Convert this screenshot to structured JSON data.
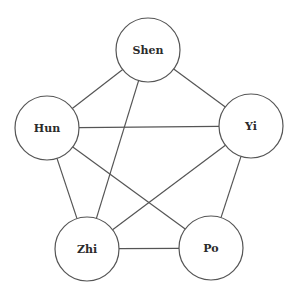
{
  "diagram": {
    "type": "complete-ish graph",
    "nodes": [
      {
        "id": "shen",
        "label": "Shen",
        "cx": 148,
        "cy": 50,
        "r": 32
      },
      {
        "id": "hun",
        "label": "Hun",
        "cx": 47,
        "cy": 128,
        "r": 32
      },
      {
        "id": "yi",
        "label": "Yi",
        "cx": 251,
        "cy": 126,
        "r": 32
      },
      {
        "id": "zhi",
        "label": "Zhi",
        "cx": 87,
        "cy": 249,
        "r": 32
      },
      {
        "id": "po",
        "label": "Po",
        "cx": 211,
        "cy": 248,
        "r": 32
      }
    ],
    "edges": [
      {
        "from": "shen",
        "to": "hun"
      },
      {
        "from": "shen",
        "to": "yi"
      },
      {
        "from": "shen",
        "to": "zhi"
      },
      {
        "from": "hun",
        "to": "yi"
      },
      {
        "from": "hun",
        "to": "zhi"
      },
      {
        "from": "hun",
        "to": "po"
      },
      {
        "from": "yi",
        "to": "zhi"
      },
      {
        "from": "yi",
        "to": "po"
      },
      {
        "from": "zhi",
        "to": "po"
      }
    ],
    "colors": {
      "stroke": "#555555",
      "label": "#2b2b2b",
      "background": "#ffffff"
    }
  }
}
